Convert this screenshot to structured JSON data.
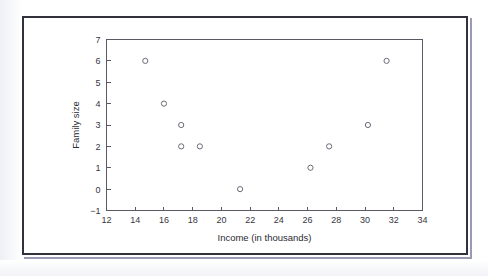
{
  "figure": {
    "frame_color": "#32323c",
    "background_color": "#ffffff",
    "axis_color": "#5a5a66",
    "marker_color": "#6b6b78"
  },
  "chart_data": {
    "type": "scatter",
    "title": "",
    "xlabel": "Income (in thousands)",
    "ylabel": "Family size",
    "xlim": [
      12,
      34
    ],
    "ylim": [
      -1,
      7
    ],
    "xticks": [
      12,
      14,
      16,
      18,
      20,
      22,
      24,
      26,
      28,
      30,
      32,
      34
    ],
    "yticks": [
      -1,
      0,
      1,
      2,
      3,
      4,
      5,
      6,
      7
    ],
    "xtick_labels": [
      "12",
      "14",
      "16",
      "18",
      "20",
      "22",
      "24",
      "26",
      "28",
      "30",
      "32",
      "34"
    ],
    "ytick_labels": [
      "−1",
      "0",
      "1",
      "2",
      "3",
      "4",
      "5",
      "6",
      "7"
    ],
    "grid": false,
    "legend": false,
    "marker_style": "open-circle",
    "points": [
      {
        "x": 14.7,
        "y": 6
      },
      {
        "x": 16.0,
        "y": 4
      },
      {
        "x": 17.2,
        "y": 3
      },
      {
        "x": 17.2,
        "y": 2
      },
      {
        "x": 18.5,
        "y": 2
      },
      {
        "x": 21.3,
        "y": 0
      },
      {
        "x": 26.2,
        "y": 1
      },
      {
        "x": 27.5,
        "y": 2
      },
      {
        "x": 30.2,
        "y": 3
      },
      {
        "x": 31.5,
        "y": 6
      }
    ]
  }
}
